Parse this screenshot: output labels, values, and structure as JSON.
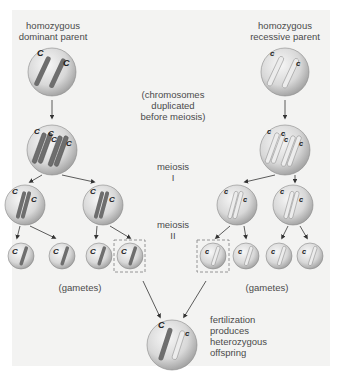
{
  "labels": {
    "dominant_parent": "homozygous\ndominant parent",
    "dominant_parent_l1": "homozygous",
    "dominant_parent_l2": "dominant parent",
    "recessive_parent_l1": "homozygous",
    "recessive_parent_l2": "recessive parent",
    "duplicated_l1": "(chromosomes",
    "duplicated_l2": "duplicated",
    "duplicated_l3": "before meiosis)",
    "meiosis1_l1": "meiosis",
    "meiosis1_l2": "I",
    "meiosis2_l1": "meiosis",
    "meiosis2_l2": "II",
    "gametes_left": "(gametes)",
    "gametes_right": "(gametes)",
    "fertilization_l1": "fertilization",
    "fertilization_l2": "produces",
    "fertilization_l3": "heterozygous",
    "fertilization_l4": "offspring"
  },
  "alleles": {
    "dominant": "C",
    "recessive": "c"
  },
  "colors": {
    "panel": "#f3f3f2",
    "dominant_chromosome": "#6e6e6e",
    "recessive_chromosome": "#e6e6e6",
    "cell_fill": "#d9d9d9",
    "text": "#4a4a4a",
    "dashed_box": "#8a8a8a"
  }
}
